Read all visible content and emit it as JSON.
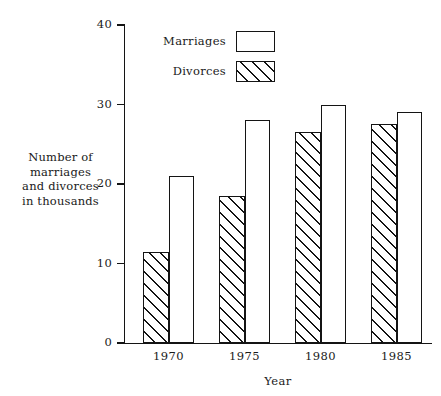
{
  "chart_data": {
    "type": "bar",
    "title": "",
    "xlabel": "Year",
    "ylabel": "Number of marriages and divorces in thousands",
    "ylabel_lines": [
      "Number of",
      "marriages",
      "and divorces",
      "in thousands"
    ],
    "categories": [
      "1970",
      "1975",
      "1980",
      "1985"
    ],
    "series": [
      {
        "name": "Divorces",
        "values": [
          11.5,
          18.5,
          26.5,
          27.5
        ],
        "fill": "hatched"
      },
      {
        "name": "Marriages",
        "values": [
          21,
          28,
          30,
          29
        ],
        "fill": "solid-white"
      }
    ],
    "legend": [
      {
        "label": "Marriages",
        "fill": "solid-white"
      },
      {
        "label": "Divorces",
        "fill": "hatched"
      }
    ],
    "legend_position": "upper-left-inside",
    "ylim": [
      0,
      40
    ],
    "ytick_labels": [
      "0",
      "10",
      "20",
      "30",
      "40"
    ],
    "ytick_values": [
      0,
      10,
      20,
      30,
      40
    ],
    "grid": false,
    "bar_order_in_group": [
      "Divorces",
      "Marriages"
    ],
    "colors": {
      "line": "#141414",
      "background": "#ffffff",
      "bar_fill": "#ffffff",
      "hatch": "#141414"
    }
  }
}
